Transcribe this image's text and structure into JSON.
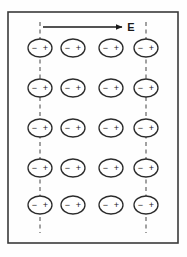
{
  "figure": {
    "background_color": "#fefefe",
    "border": {
      "name": "figure-border",
      "color": "#3a3a3a",
      "x": 8,
      "y": 12,
      "width": 170,
      "height": 231,
      "stroke_width": 1.6
    },
    "field_arrow": {
      "label": "E",
      "label_x": 131,
      "label_y": 31,
      "line_x1": 43,
      "line_x2": 122,
      "line_y": 27,
      "color": "#1a1a1a",
      "direction": "right"
    },
    "dashed_lines": [
      {
        "x": 40,
        "y1": 22,
        "y2": 233,
        "color": "#555555"
      },
      {
        "x": 146,
        "y1": 22,
        "y2": 233,
        "color": "#555555"
      }
    ],
    "dipole": {
      "rx": 12,
      "ry": 9,
      "stroke": "#2b2b2b",
      "stroke_width": 1.3,
      "fill": "#ffffff",
      "minus_symbol": "−",
      "plus_symbol": "+",
      "minus_offset_x": -5.5,
      "plus_offset_x": 5.5,
      "symbol_font_size": 9
    },
    "grid": {
      "columns_x": [
        40,
        73,
        111,
        146
      ],
      "rows_y": [
        48,
        88,
        128,
        168,
        205
      ],
      "column_count": 4,
      "row_count": 5,
      "total_dipoles": 20
    },
    "legend_note": "Each ellipse is a dipole: negative charge at left, positive charge at right"
  }
}
